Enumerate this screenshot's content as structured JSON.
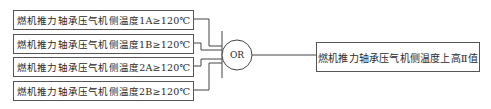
{
  "inputs": [
    {
      "label": "燃机推力轴承压气机侧温度1A≥120℃"
    },
    {
      "label": "燃机推力轴承压气机侧温度1B≥120℃"
    },
    {
      "label": "燃机推力轴承压气机侧温度2A≥120℃"
    },
    {
      "label": "燃机推力轴承压气机侧温度2B≥120℃"
    }
  ],
  "gate": {
    "label": "OR"
  },
  "output": {
    "label": "燃机推力轴承压气机侧温度上高Ⅱ值"
  },
  "colors": {
    "line": "#444444",
    "box_border": "#555555"
  }
}
